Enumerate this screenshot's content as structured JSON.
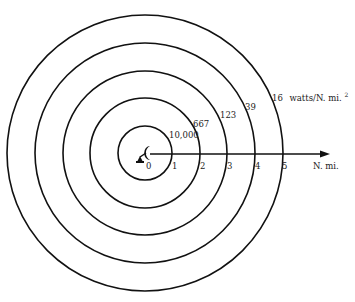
{
  "diagram": {
    "center": {
      "x": 145,
      "y": 153
    },
    "ring_spacing_px": 27.6,
    "rings": [
      {
        "radius_nmi": 1,
        "density_label": "10,000"
      },
      {
        "radius_nmi": 2,
        "density_label": "667"
      },
      {
        "radius_nmi": 3,
        "density_label": "123"
      },
      {
        "radius_nmi": 4,
        "density_label": "39"
      },
      {
        "radius_nmi": 5,
        "density_label": "16"
      }
    ],
    "outer_unit_label": "watts/N. mi.",
    "outer_unit_superscript": "2",
    "axis": {
      "tick_labels": [
        "0",
        "1",
        "2",
        "3",
        "4",
        "5"
      ],
      "unit_label": "N. mi."
    },
    "center_icon": "radar-antenna-icon",
    "line_color": "#111111",
    "text_color": "#222222"
  }
}
